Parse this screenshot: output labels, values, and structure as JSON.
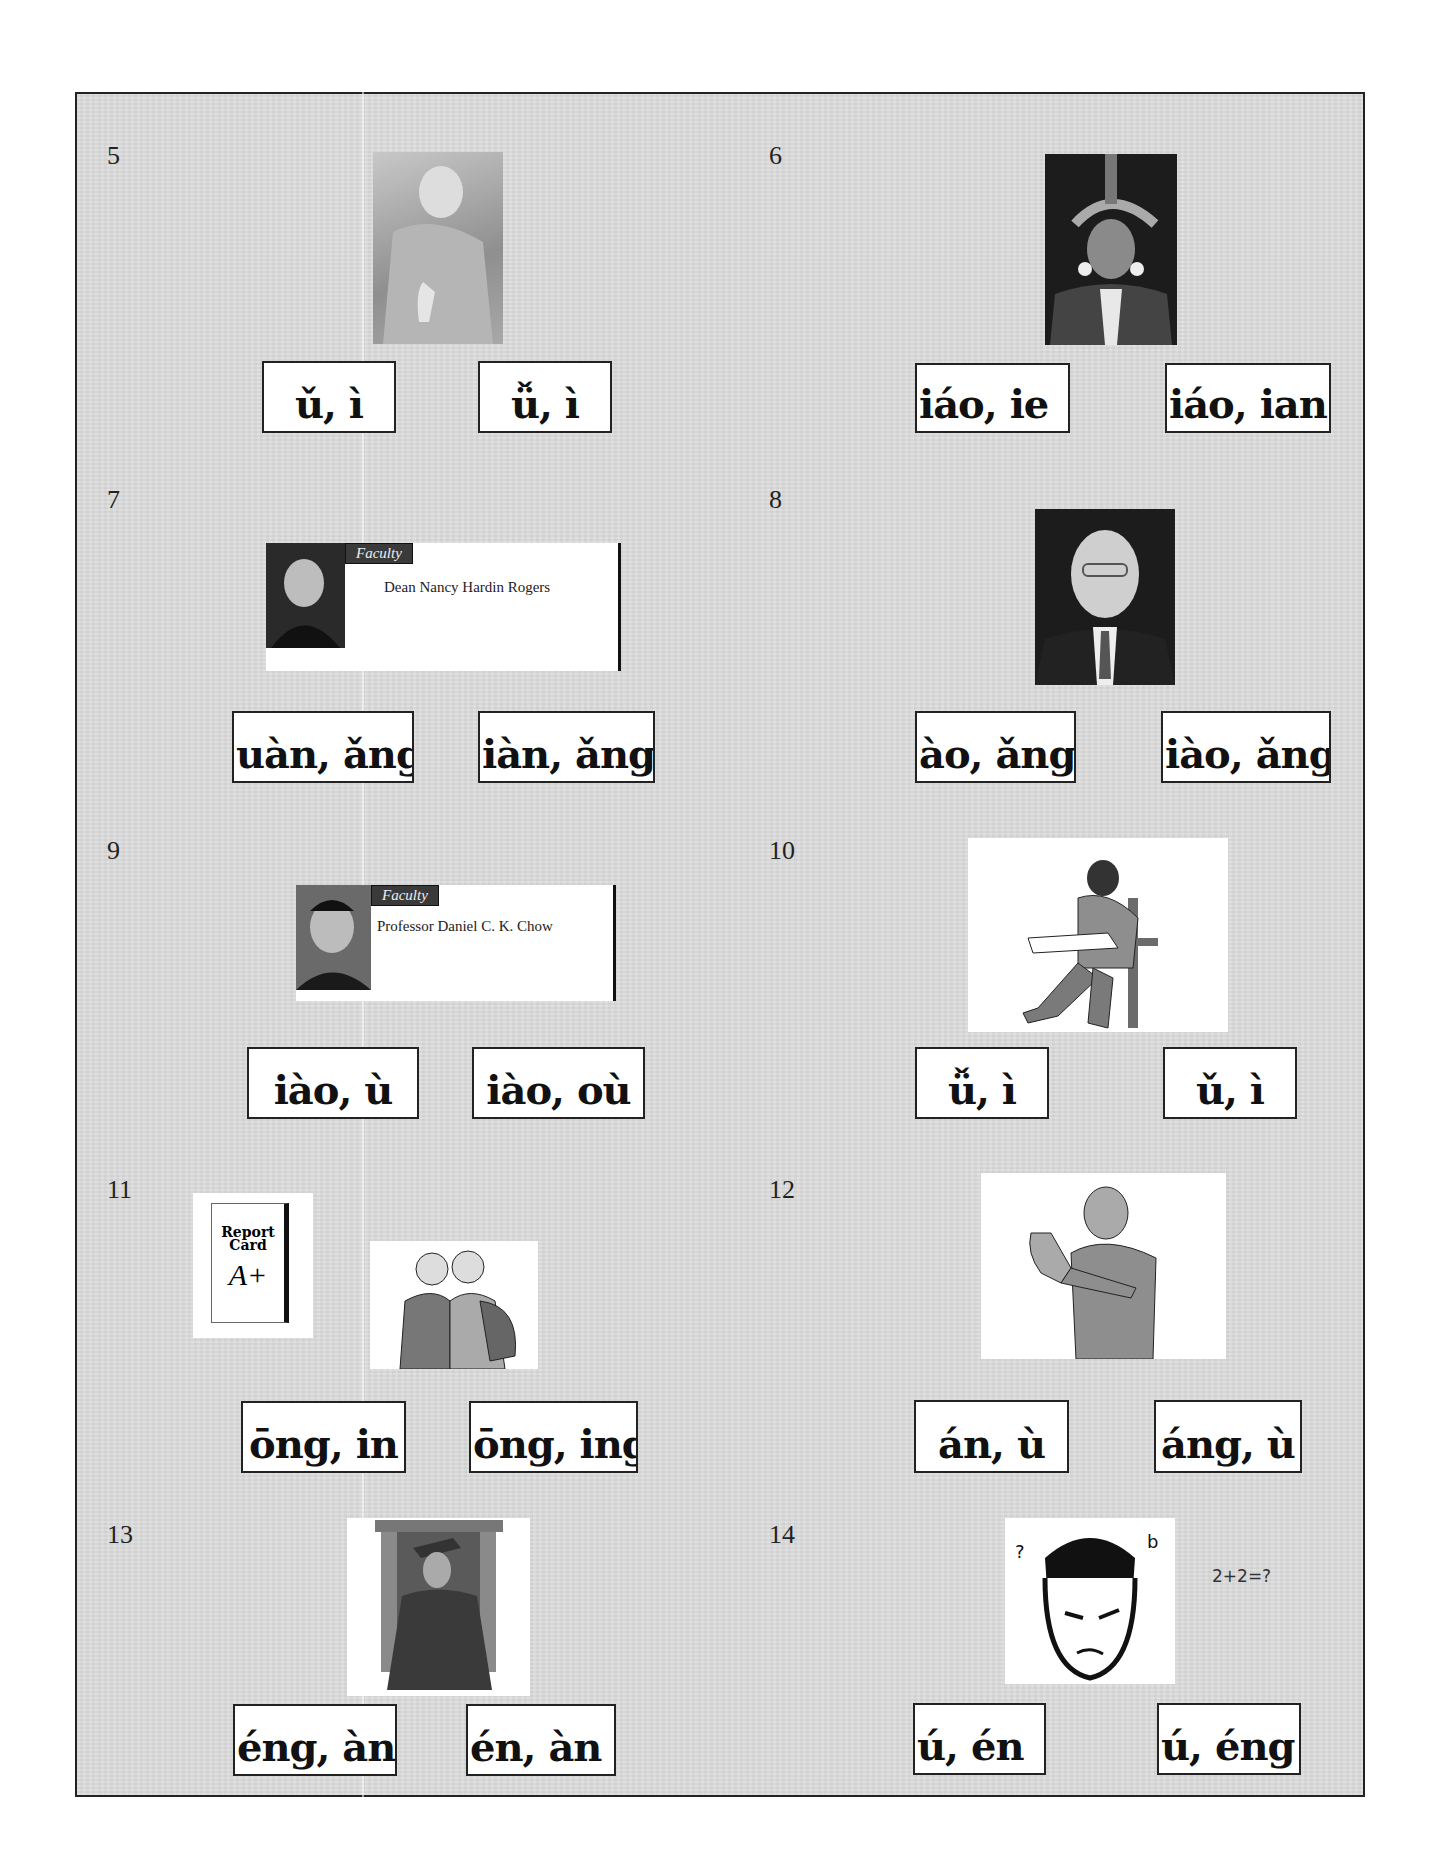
{
  "worksheet": {
    "items": [
      {
        "number": "5",
        "image": "woman-thumbs-down-photo",
        "options": [
          "ǔ, ì",
          "ǚ, ì"
        ]
      },
      {
        "number": "6",
        "image": "woman-feather-headdress-photo",
        "options": [
          "iáo, ie",
          "iáo, ian"
        ]
      },
      {
        "number": "7",
        "image": "faculty-card-woman",
        "card": {
          "tag": "Faculty",
          "name": "Dean Nancy Hardin Rogers"
        },
        "options": [
          "uàn, ǎng",
          "iàn, ǎng"
        ]
      },
      {
        "number": "8",
        "image": "man-glasses-suit-photo",
        "options": [
          "ào, ǎng",
          "iào, ǎng"
        ]
      },
      {
        "number": "9",
        "image": "faculty-card-man",
        "card": {
          "tag": "Faculty",
          "name": "Professor Daniel C. K. Chow"
        },
        "options": [
          "iào, ù",
          "iào, où"
        ]
      },
      {
        "number": "10",
        "image": "man-studying-chair-clipart",
        "options": [
          "ǚ, ì",
          "ǔ, ì"
        ]
      },
      {
        "number": "11",
        "image": "report-card-and-students-clipart",
        "report_card": {
          "title_line1": "Report",
          "title_line2": "Card",
          "grade": "A+"
        },
        "options": [
          "ōng, in",
          "ōng, ing"
        ]
      },
      {
        "number": "12",
        "image": "man-refusing-clipart",
        "options": [
          "án, ù",
          "áng, ù"
        ]
      },
      {
        "number": "13",
        "image": "graduate-clipart",
        "options": [
          "éng, àn",
          "én, àn"
        ]
      },
      {
        "number": "14",
        "image": "confused-man-face-clipart",
        "caption": "2+2=?",
        "options": [
          "ú, én",
          "ú, éng"
        ]
      }
    ]
  }
}
